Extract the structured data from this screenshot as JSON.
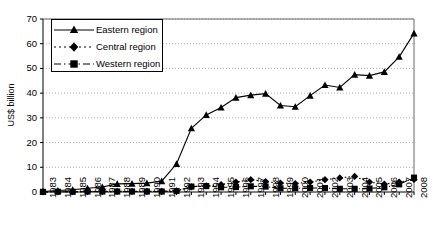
{
  "chart_data": {
    "type": "line",
    "title": "",
    "xlabel": "",
    "ylabel": "US$ billion",
    "ylim": [
      0,
      70
    ],
    "yticks": [
      0,
      10,
      20,
      30,
      40,
      50,
      60,
      70
    ],
    "grid": "horizontal-dotted",
    "legend_position": "top-left-inside",
    "categories": [
      "1983",
      "1984",
      "1985",
      "1986",
      "1987",
      "1988",
      "1989",
      "1990",
      "1991",
      "1992",
      "1993",
      "1994",
      "1995",
      "1996",
      "1997",
      "1998",
      "1999",
      "2000",
      "2001",
      "2002",
      "2003",
      "2004",
      "2005",
      "2006",
      "2007",
      "2008"
    ],
    "series": [
      {
        "name": "Eastern region",
        "marker": "triangle",
        "line": "solid",
        "color": "#000000",
        "values": [
          0.2,
          0.6,
          0.9,
          1.5,
          2.0,
          3.3,
          3.4,
          3.6,
          4.4,
          11.4,
          25.8,
          31.2,
          34.2,
          38.2,
          39.2,
          39.8,
          35.0,
          34.5,
          39.0,
          43.3,
          42.3,
          47.5,
          47.1,
          48.6,
          54.7,
          64.2
        ]
      },
      {
        "name": "Central region",
        "marker": "diamond",
        "line": "dotted",
        "color": "#000000",
        "values": [
          0.05,
          0.1,
          0.1,
          0.2,
          0.3,
          0.3,
          0.3,
          0.3,
          0.3,
          0.5,
          2.1,
          2.5,
          3.0,
          4.0,
          5.0,
          4.2,
          3.6,
          3.4,
          4.0,
          5.0,
          5.7,
          6.3,
          4.0,
          3.2,
          4.0,
          5.1
        ]
      },
      {
        "name": "Western region",
        "marker": "square",
        "line": "dash-dot",
        "color": "#000000",
        "values": [
          0.05,
          0.1,
          0.1,
          0.2,
          0.2,
          0.2,
          0.2,
          0.2,
          0.2,
          0.4,
          2.2,
          2.4,
          1.9,
          2.0,
          2.3,
          2.2,
          1.5,
          1.5,
          1.6,
          1.6,
          1.3,
          1.3,
          1.4,
          1.9,
          3.1,
          5.8
        ]
      }
    ]
  }
}
